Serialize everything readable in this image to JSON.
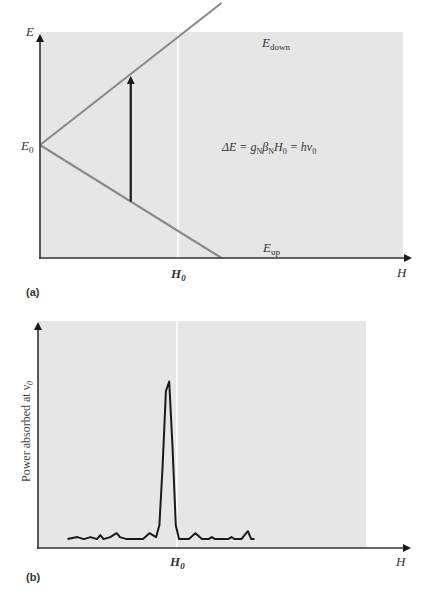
{
  "figure": {
    "panel_a": {
      "label": "(a)",
      "y_axis_label": "E",
      "x_axis_label": "H",
      "e0_label": "E",
      "e0_sub": "0",
      "h0_label": "H",
      "h0_sub": "0",
      "e_down_label": "E",
      "e_down_sub": "down",
      "e_up_label": "E",
      "e_up_sub": "up",
      "equation": {
        "delta_e": "ΔE = g",
        "sub_n1": "N",
        "beta": "β",
        "sub_n2": "N",
        "h": "H",
        "sub_0a": "0",
        "eq2": " = hν",
        "sub_0b": "0"
      }
    },
    "panel_b": {
      "label": "(b)",
      "y_axis_label": "Power absorbed at ν",
      "y_axis_sub": "0",
      "x_axis_label": "H",
      "h0_label": "H",
      "h0_sub": "0"
    },
    "colors": {
      "plot_bg": "#e6e6e6",
      "energy_lines": "#8a8a8a",
      "axis": "#333333",
      "marker_line": "#ffffff",
      "arrow": "#1a1a1a",
      "spectrum": "#1a1a1a"
    }
  },
  "chart_data": [
    {
      "type": "line",
      "title": "Nuclear Zeeman splitting of energy levels",
      "xlabel": "H",
      "ylabel": "E",
      "xlim": [
        0,
        1.2
      ],
      "ylim": [
        -1,
        1
      ],
      "series": [
        {
          "name": "E_down",
          "x": [
            0,
            0.6
          ],
          "y": [
            0,
            1.0
          ]
        },
        {
          "name": "E_up",
          "x": [
            0,
            0.6
          ],
          "y": [
            0,
            -1.0
          ]
        }
      ],
      "annotations": [
        {
          "text": "E_0",
          "at": "y-axis intercept (H = 0)"
        },
        {
          "text": "H_0",
          "at": "x = 0.3 (resonance field, vertical marker)"
        },
        {
          "text": "ΔE = g_N β_N H_0 = hν_0",
          "at": "right of transition arrow"
        },
        {
          "text": "transition arrow",
          "from": "E_up at H_0",
          "to": "E_down at H_0"
        }
      ],
      "grid": false
    },
    {
      "type": "line",
      "title": "Absorption spectrum",
      "xlabel": "H",
      "ylabel": "Power absorbed at ν_0",
      "xlim": [
        0,
        1.0
      ],
      "ylim": [
        0,
        1.0
      ],
      "series": [
        {
          "name": "absorption",
          "x": [
            0.09,
            0.12,
            0.14,
            0.16,
            0.18,
            0.19,
            0.2,
            0.22,
            0.24,
            0.25,
            0.27,
            0.29,
            0.3,
            0.32,
            0.34,
            0.36,
            0.37,
            0.38,
            0.39,
            0.4,
            0.41,
            0.42,
            0.43,
            0.44,
            0.45,
            0.46,
            0.48,
            0.5,
            0.52,
            0.53,
            0.54,
            0.56,
            0.58,
            0.59,
            0.6,
            0.62,
            0.63,
            0.64,
            0.65,
            0.66
          ],
          "y": [
            0.03,
            0.04,
            0.03,
            0.04,
            0.03,
            0.05,
            0.03,
            0.04,
            0.06,
            0.04,
            0.03,
            0.03,
            0.03,
            0.03,
            0.06,
            0.04,
            0.1,
            0.4,
            0.78,
            0.83,
            0.5,
            0.1,
            0.03,
            0.03,
            0.03,
            0.03,
            0.06,
            0.03,
            0.03,
            0.04,
            0.03,
            0.03,
            0.03,
            0.04,
            0.03,
            0.03,
            0.05,
            0.07,
            0.03,
            0.03
          ]
        }
      ],
      "annotations": [
        {
          "text": "H_0",
          "at": "x = 0.40 (peak position, vertical marker)"
        }
      ],
      "grid": false
    }
  ]
}
